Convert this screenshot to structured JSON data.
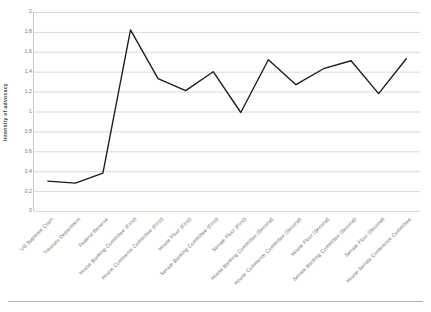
{
  "chart_data": {
    "type": "line",
    "title": "",
    "xlabel": "",
    "ylabel": "Intensity of  advocacy",
    "ylim": [
      0,
      2
    ],
    "ytick_step": 0.2,
    "yticks": [
      "0",
      "0.2",
      "0.4",
      "0.6",
      "0.8",
      "1",
      "1.2",
      "1.4",
      "1.6",
      "1.8",
      "2"
    ],
    "grid": "horizontal",
    "legend": "none",
    "line_color": "#1a1a1a",
    "grid_color": "#d9d9d9",
    "categories": [
      "US Supreme Court",
      "Treasury Department",
      "Federal Reserve",
      "House Banking Committee (First)",
      "House Commerce Committee (First)",
      "House Floor (First)",
      "Senate Banking Committee (First)",
      "Senate Floor (First)",
      "House Banking Committee (Second)",
      "House Commerce Committee (Second)",
      "House Floor (Second)",
      "Senate Banking Committee (Second)",
      "Senate Floor (Second)",
      "House-Senate Conference Committee"
    ],
    "values": [
      0.3,
      0.28,
      0.38,
      1.82,
      1.33,
      1.21,
      1.4,
      0.99,
      1.52,
      1.27,
      1.43,
      1.51,
      1.18,
      1.53
    ],
    "series": [
      {
        "name": "Intensity of advocacy",
        "values": [
          0.3,
          0.28,
          0.38,
          1.82,
          1.33,
          1.21,
          1.4,
          0.99,
          1.52,
          1.27,
          1.43,
          1.51,
          1.18,
          1.53
        ]
      }
    ]
  },
  "axis": {
    "y_title": "Intensity of  advocacy"
  }
}
